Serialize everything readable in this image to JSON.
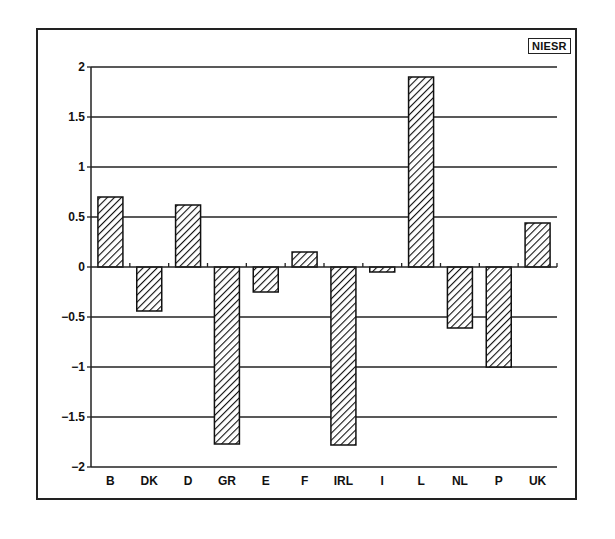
{
  "badge": "NIESR",
  "chart_data": {
    "type": "bar",
    "title": "",
    "xlabel": "",
    "ylabel": "",
    "categories": [
      "B",
      "DK",
      "D",
      "GR",
      "E",
      "F",
      "IRL",
      "I",
      "L",
      "NL",
      "P",
      "UK"
    ],
    "values": [
      0.7,
      -0.44,
      0.62,
      -1.77,
      -0.25,
      0.15,
      -1.78,
      -0.05,
      1.9,
      -0.61,
      -1.0,
      0.44
    ],
    "ylim": [
      -2,
      2
    ],
    "yticks": [
      2,
      1.5,
      1,
      0.5,
      0,
      -0.5,
      -1,
      -1.5,
      -2
    ],
    "ytick_labels": [
      "2",
      "1.5",
      "1",
      "0.5",
      "0",
      "−0.5",
      "−1",
      "−1.5",
      "−2"
    ],
    "grid": true,
    "bar_fill": "diagonal-hatch",
    "legend": null
  }
}
